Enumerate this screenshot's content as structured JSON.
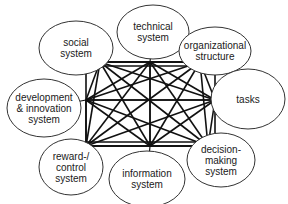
{
  "diagram": {
    "type": "fully-connected network of organizational subsystems",
    "nodes": [
      {
        "id": "technical",
        "lines": [
          "technical",
          "system"
        ],
        "cx": 153,
        "cy": 32,
        "rx": 36,
        "ry": 27
      },
      {
        "id": "organizational",
        "lines": [
          "organizational",
          "structure"
        ],
        "cx": 215,
        "cy": 51,
        "rx": 36,
        "ry": 24
      },
      {
        "id": "tasks",
        "lines": [
          "tasks"
        ],
        "cx": 248,
        "cy": 99,
        "rx": 37,
        "ry": 30
      },
      {
        "id": "decision",
        "lines": [
          "decision-",
          "making",
          "system"
        ],
        "cx": 221,
        "cy": 160,
        "rx": 34,
        "ry": 27
      },
      {
        "id": "information",
        "lines": [
          "information",
          "system"
        ],
        "cx": 147,
        "cy": 179,
        "rx": 38,
        "ry": 28
      },
      {
        "id": "reward",
        "lines": [
          "reward-/",
          "control",
          "system"
        ],
        "cx": 71,
        "cy": 167,
        "rx": 32,
        "ry": 28
      },
      {
        "id": "development",
        "lines": [
          "development",
          "& innovation",
          "system"
        ],
        "cx": 44,
        "cy": 108,
        "rx": 37,
        "ry": 29
      },
      {
        "id": "social",
        "lines": [
          "social",
          "system"
        ],
        "cx": 76,
        "cy": 48,
        "rx": 37,
        "ry": 27
      }
    ],
    "frame": {
      "x1": 86,
      "y1": 62,
      "x2": 215,
      "y2": 146
    },
    "anchors": [
      {
        "id": "technical",
        "x": 150,
        "y": 62
      },
      {
        "id": "organizational",
        "x": 200,
        "y": 62
      },
      {
        "id": "tasks",
        "x": 215,
        "y": 100
      },
      {
        "id": "decision",
        "x": 208,
        "y": 146
      },
      {
        "id": "information",
        "x": 150,
        "y": 146
      },
      {
        "id": "reward",
        "x": 86,
        "y": 146
      },
      {
        "id": "development",
        "x": 86,
        "y": 100
      },
      {
        "id": "social",
        "x": 100,
        "y": 62
      }
    ],
    "stroke_color": "#111111",
    "ellipse_stroke": "#333333"
  }
}
